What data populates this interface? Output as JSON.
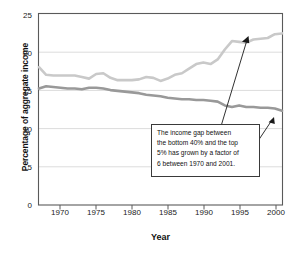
{
  "chart_data": {
    "type": "line",
    "title": "",
    "xlabel": "Year",
    "ylabel": "Percentage of aggregate income",
    "xlim": [
      1967,
      2001
    ],
    "ylim": [
      0,
      25
    ],
    "xticks": [
      "1970",
      "1975",
      "1980",
      "1985",
      "1990",
      "1995",
      "2000"
    ],
    "xtick_values": [
      1970,
      1975,
      1980,
      1985,
      1990,
      1995,
      2000
    ],
    "yticks": [
      "0",
      "5",
      "10",
      "15",
      "20",
      "25"
    ],
    "ytick_values": [
      0,
      5,
      10,
      15,
      20,
      25
    ],
    "grid": "horizontal",
    "legend": "none",
    "x": [
      1967,
      1968,
      1969,
      1970,
      1971,
      1972,
      1973,
      1974,
      1975,
      1976,
      1977,
      1978,
      1979,
      1980,
      1981,
      1982,
      1983,
      1984,
      1985,
      1986,
      1987,
      1988,
      1989,
      1990,
      1991,
      1992,
      1993,
      1994,
      1995,
      1996,
      1997,
      1998,
      1999,
      2000,
      2001
    ],
    "series": [
      {
        "name": "Top 5 percent share",
        "color": "#c9c9c9",
        "values": [
          18.0,
          17.0,
          16.9,
          16.9,
          16.9,
          16.9,
          16.7,
          16.5,
          17.1,
          17.2,
          16.6,
          16.3,
          16.3,
          16.3,
          16.4,
          16.7,
          16.6,
          16.2,
          16.5,
          17.0,
          17.2,
          17.8,
          18.4,
          18.6,
          18.4,
          19.0,
          20.3,
          21.4,
          21.3,
          21.2,
          21.6,
          21.7,
          21.8,
          22.3,
          22.4
        ]
      },
      {
        "name": "Bottom 40 percent share",
        "color": "#999999",
        "values": [
          15.2,
          15.5,
          15.4,
          15.3,
          15.2,
          15.2,
          15.1,
          15.3,
          15.3,
          15.2,
          15.0,
          14.9,
          14.8,
          14.7,
          14.6,
          14.4,
          14.3,
          14.2,
          14.0,
          13.9,
          13.8,
          13.8,
          13.7,
          13.7,
          13.6,
          13.5,
          13.0,
          12.8,
          13.0,
          12.8,
          12.8,
          12.7,
          12.7,
          12.6,
          12.3
        ]
      }
    ],
    "annotation": {
      "text": "The income gap between the bottom 40% and the top 5% has grown by a factor of 6 between 1970 and 2001.",
      "lines": [
        "The income gap between",
        "the bottom 40% and the top",
        "5% has grown by a factor of",
        "6 between 1970 and 2001."
      ],
      "arrows": 2
    },
    "colors": {
      "top_line": "#c9c9c9",
      "bottom_line": "#999999",
      "grid": "#d8d8d8",
      "axis": "#555555",
      "annotation_border": "#3a3a3a",
      "text": "#111111"
    }
  }
}
